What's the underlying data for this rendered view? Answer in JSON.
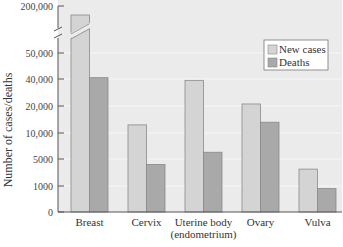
{
  "chart_data": {
    "type": "bar",
    "title": "",
    "xlabel": "",
    "ylabel": "Number of cases/deaths",
    "categories": [
      "Breast",
      "Cervix",
      "Uterine body\n(endometrium)",
      "Ovary",
      "Vulva"
    ],
    "category_lines": [
      [
        "Breast"
      ],
      [
        "Cervix"
      ],
      [
        "Uterine body",
        "(endometrium)"
      ],
      [
        "Ovary"
      ],
      [
        "Vulva"
      ]
    ],
    "series": [
      {
        "name": "New cases",
        "values": [
          190000,
          13000,
          39000,
          21500,
          3500
        ],
        "color": "#d4d4d4"
      },
      {
        "name": "Deaths",
        "values": [
          40500,
          4200,
          6300,
          14000,
          900
        ],
        "color": "#a9a9a9"
      }
    ],
    "y_ticks": [
      0,
      1000,
      5000,
      10000,
      20000,
      40000,
      50000,
      200000
    ],
    "y_tick_labels": [
      "0",
      "1000",
      "5000",
      "10,000",
      "20,000",
      "40,000",
      "50,000",
      "200,000"
    ],
    "y_tick_px": [
      212,
      186,
      159,
      133,
      106,
      79,
      53,
      6
    ],
    "axis_break": {
      "between": [
        50000,
        200000
      ]
    },
    "ylim": [
      0,
      200000
    ],
    "y_scale": "non-linear (piecewise)",
    "grid": true,
    "legend_position": "upper right",
    "background": "#ebebeb"
  }
}
